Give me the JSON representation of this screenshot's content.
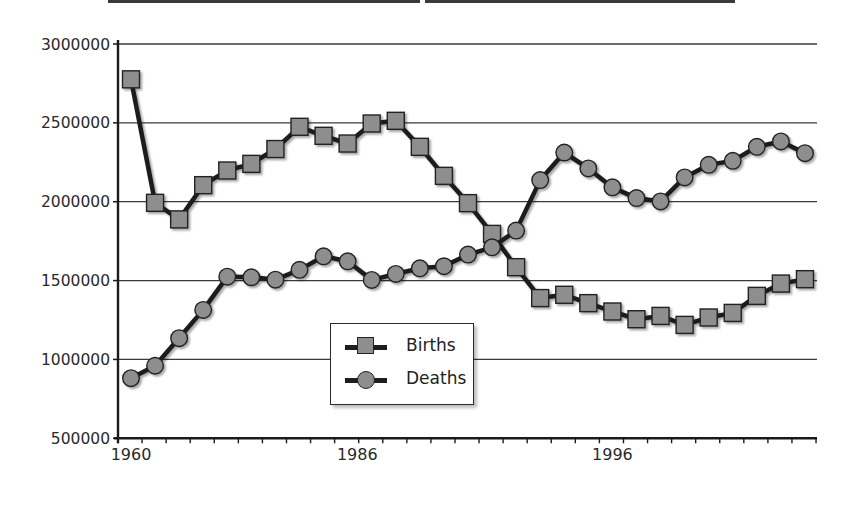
{
  "chart_data": {
    "type": "line",
    "title": "",
    "xlabel": "",
    "ylabel": "",
    "ylim": [
      500000,
      3000000
    ],
    "yticks": [
      500000,
      1000000,
      1500000,
      2000000,
      2500000,
      3000000
    ],
    "ytick_labels": [
      "500000",
      "1000000",
      "1500000",
      "2000000",
      "2500000",
      "3000000"
    ],
    "xtick_labels": [
      {
        "label": "1960",
        "index": 0
      },
      {
        "label": "1986",
        "index": 9.4
      },
      {
        "label": "1996",
        "index": 20
      }
    ],
    "grid": true,
    "legend_position": "center-inside",
    "point_count": 29,
    "series": [
      {
        "name": "Births",
        "marker": "square",
        "values": [
          2776000,
          1993000,
          1888000,
          2105000,
          2198000,
          2240000,
          2334000,
          2475000,
          2418000,
          2369000,
          2496000,
          2513000,
          2348000,
          2164000,
          1991000,
          1796000,
          1585000,
          1389000,
          1410000,
          1357000,
          1304000,
          1255000,
          1276000,
          1219000,
          1266000,
          1295000,
          1403000,
          1481000,
          1509000
        ]
      },
      {
        "name": "Deaths",
        "marker": "circle",
        "values": [
          881000,
          960000,
          1135000,
          1314000,
          1525000,
          1521000,
          1506000,
          1568000,
          1654000,
          1622000,
          1504000,
          1542000,
          1578000,
          1591000,
          1665000,
          1711000,
          1817000,
          2137000,
          2312000,
          2211000,
          2091000,
          2023000,
          2002000,
          2154000,
          2234000,
          2259000,
          2348000,
          2382000,
          2308000
        ]
      }
    ]
  },
  "legend": {
    "items": [
      {
        "label": "Births",
        "marker": "square-icon"
      },
      {
        "label": "Deaths",
        "marker": "circle-icon"
      }
    ]
  },
  "colors": {
    "line": "#1e1e1e",
    "marker_fill": "#8e8e8e",
    "gridline": "#3a3a3a",
    "axis": "#1a1a1a"
  }
}
